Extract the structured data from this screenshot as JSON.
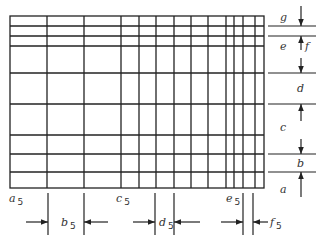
{
  "diagram": {
    "grid": {
      "left": 10,
      "right": 264,
      "top": 16,
      "bottom": 188,
      "vertical_lines": [
        47,
        84,
        121,
        139,
        156,
        174,
        191,
        208,
        226,
        234,
        243,
        255
      ],
      "horizontal_lines": [
        26,
        36,
        46,
        73,
        104,
        135,
        154,
        172
      ]
    },
    "right_labels": {
      "g": "g",
      "e": "e",
      "f": "f",
      "d": "d",
      "c": "c",
      "b": "b",
      "a": "a"
    },
    "bottom_labels": {
      "a5_main": "a",
      "a5_sub": "5",
      "b5_main": "b",
      "b5_sub": "5",
      "c5_main": "c",
      "c5_sub": "5",
      "d5_main": "d",
      "d5_sub": "5",
      "e5_main": "e",
      "e5_sub": "5",
      "f5_main": "f",
      "f5_sub": "5"
    },
    "colors": {
      "line": "#222222",
      "text": "#333333",
      "background": "#ffffff"
    }
  }
}
